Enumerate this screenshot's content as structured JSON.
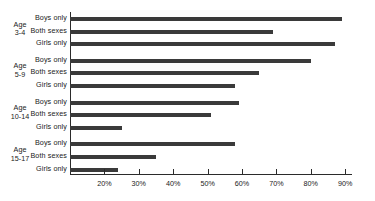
{
  "chart_data": {
    "type": "bar",
    "orientation": "horizontal",
    "title": "",
    "subtitle": "",
    "xlabel": "",
    "ylabel": "",
    "xlim": [
      10,
      90
    ],
    "axis_start_value": 10,
    "grid": false,
    "legend": "none",
    "tick_labels": [
      "20%",
      "30%",
      "40%",
      "50%",
      "60%",
      "70%",
      "80%",
      "90%"
    ],
    "tick_values": [
      20,
      30,
      40,
      50,
      60,
      70,
      80,
      90
    ],
    "categories": [
      "Boys only",
      "Both sexes",
      "Girls only"
    ],
    "groups": [
      {
        "label_line1": "Age",
        "label_line2": "3-4",
        "bars": [
          {
            "category": "Boys only",
            "value": 89
          },
          {
            "category": "Both sexes",
            "value": 69
          },
          {
            "category": "Girls only",
            "value": 87
          }
        ]
      },
      {
        "label_line1": "Age",
        "label_line2": "5-9",
        "bars": [
          {
            "category": "Boys only",
            "value": 80
          },
          {
            "category": "Both sexes",
            "value": 65
          },
          {
            "category": "Girls only",
            "value": 58
          }
        ]
      },
      {
        "label_line1": "Age",
        "label_line2": "10-14",
        "bars": [
          {
            "category": "Boys only",
            "value": 59
          },
          {
            "category": "Both sexes",
            "value": 51
          },
          {
            "category": "Girls only",
            "value": 25
          }
        ]
      },
      {
        "label_line1": "Age",
        "label_line2": "15-17",
        "bars": [
          {
            "category": "Boys only",
            "value": 58
          },
          {
            "category": "Both sexes",
            "value": 35
          },
          {
            "category": "Girls only",
            "value": 24
          }
        ]
      }
    ],
    "colors": {
      "bar": "#3a3a3a",
      "axis": "#2b2b2b",
      "text": "#1a1a1a",
      "background": "#ffffff"
    }
  }
}
